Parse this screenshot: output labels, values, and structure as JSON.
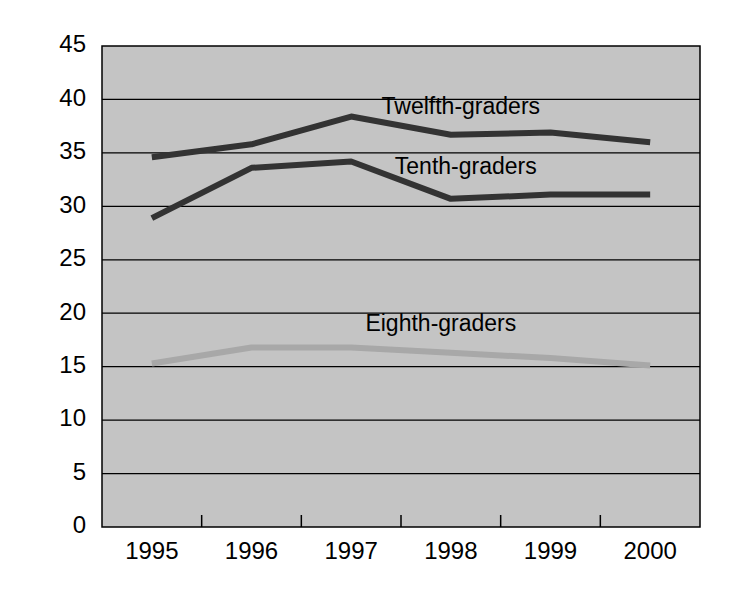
{
  "chart_data": {
    "type": "line",
    "title": "",
    "subtitle": "",
    "xlabel": "",
    "ylabel": "",
    "categories": [
      "1995",
      "1996",
      "1997",
      "1998",
      "1999",
      "2000"
    ],
    "x": [
      1995,
      1996,
      1997,
      1998,
      1999,
      2000
    ],
    "ylim": [
      0,
      45
    ],
    "ytick_labels": [
      "0",
      "5",
      "10",
      "15",
      "20",
      "25",
      "30",
      "35",
      "40",
      "45"
    ],
    "ytick_values": [
      0,
      5,
      10,
      15,
      20,
      25,
      30,
      35,
      40,
      45
    ],
    "grid": true,
    "grid_axis": "y",
    "legend_position": "inline-labels",
    "plot_background": "#c4c4c4",
    "series": [
      {
        "name": "Twelfth-graders",
        "label": "Twelfth-graders",
        "color": "#333333",
        "values": [
          34.6,
          35.8,
          38.4,
          36.7,
          36.9,
          36.0
        ],
        "label_x": 1998.1,
        "label_y": 39.2
      },
      {
        "name": "Tenth-graders",
        "label": "Tenth-graders",
        "color": "#333333",
        "values": [
          28.9,
          33.6,
          34.2,
          30.7,
          31.1,
          31.1
        ],
        "label_x": 1998.15,
        "label_y": 33.6
      },
      {
        "name": "Eighth-graders",
        "label": "Eighth-graders",
        "color": "#a8a8a8",
        "values": [
          15.3,
          16.8,
          16.8,
          16.3,
          15.8,
          15.1
        ],
        "label_x": 1997.9,
        "label_y": 18.9
      }
    ]
  },
  "axes": {
    "y_axis_name": "value-axis",
    "x_axis_name": "year-axis"
  }
}
